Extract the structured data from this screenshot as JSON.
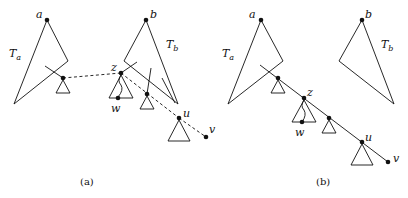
{
  "panels": [
    {
      "id": "a",
      "caption": "(a)",
      "labels": {
        "a": "a",
        "b": "b",
        "Ta": "T",
        "Ta_sub": "a",
        "Tb": "T",
        "Tb_sub": "b",
        "z": "z",
        "w": "w",
        "u": "u",
        "v": "v"
      }
    },
    {
      "id": "b",
      "caption": "(b)",
      "labels": {
        "a": "a",
        "b": "b",
        "Ta": "T",
        "Ta_sub": "a",
        "Tb": "T",
        "Tb_sub": "b",
        "z": "z",
        "w": "w",
        "u": "u",
        "v": "v"
      }
    }
  ],
  "colors": {
    "stroke": "#111111",
    "background": "#ffffff"
  }
}
